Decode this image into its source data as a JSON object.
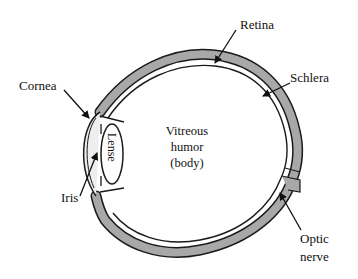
{
  "diagram": {
    "labels": {
      "retina": "Retina",
      "schlera": "Schlera",
      "cornea": "Cornea",
      "lense": "Lense",
      "iris": "Iris",
      "vitreous_line1": "Vitreous",
      "vitreous_line2": "humor",
      "vitreous_line3": "(body)",
      "optic_line1": "Optic",
      "optic_line2": "nerve"
    },
    "colors": {
      "wall_fill": "#a8a8a8",
      "outline": "#1a1a1a",
      "background": "#ffffff"
    }
  }
}
